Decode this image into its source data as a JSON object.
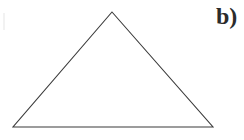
{
  "figure": {
    "background_color": "#ffffff",
    "stroke_color": "#3a3a3a",
    "stroke_width": 1.1,
    "fill": "none",
    "width": 244,
    "height": 140,
    "shape_type": "triangle",
    "label": "b)",
    "label_color": "#2b2b2b",
    "vertices": [
      {
        "name": "apex",
        "x": 112,
        "y": 12
      },
      {
        "name": "bottom-right",
        "x": 213,
        "y": 127
      },
      {
        "name": "bottom-left",
        "x": 13,
        "y": 127
      }
    ],
    "polygon_points": "112,12 213,127 13,127",
    "edges": [
      {
        "name": "left-edge",
        "x1": 13,
        "y1": 127,
        "x2": 112,
        "y2": 12
      },
      {
        "name": "right-edge",
        "x1": 112,
        "y1": 12,
        "x2": 213,
        "y2": 127
      },
      {
        "name": "base-edge",
        "x1": 13,
        "y1": 127,
        "x2": 213,
        "y2": 127
      }
    ]
  }
}
